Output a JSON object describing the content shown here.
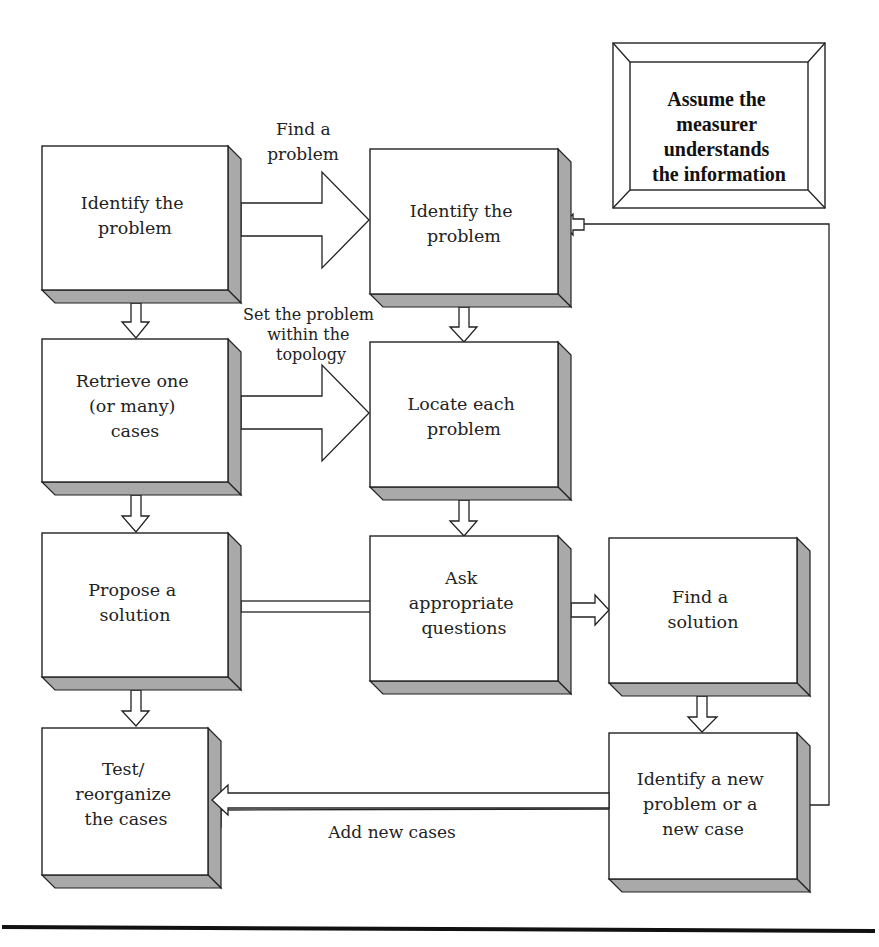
{
  "note_box": {
    "lines": [
      "Assume the",
      "measurer",
      "understands",
      "the information"
    ]
  },
  "boxes": {
    "identify_problem_left": {
      "lines": [
        "Identify the",
        "problem"
      ]
    },
    "retrieve_cases": {
      "lines": [
        "Retrieve one",
        "(or many)",
        "cases"
      ]
    },
    "propose_solution": {
      "lines": [
        "Propose a",
        "solution"
      ]
    },
    "test_reorganize": {
      "lines": [
        "Test/",
        "reorganize",
        "the cases"
      ]
    },
    "identify_problem_mid": {
      "lines": [
        "Identify the",
        "problem"
      ]
    },
    "locate_problem": {
      "lines": [
        "Locate each",
        "problem"
      ]
    },
    "ask_questions": {
      "lines": [
        "Ask",
        "appropriate",
        "questions"
      ]
    },
    "find_solution": {
      "lines": [
        "Find a",
        "solution"
      ]
    },
    "identify_new_problem": {
      "lines": [
        "Identify a new",
        "problem or a",
        "new case"
      ]
    }
  },
  "arrow_labels": {
    "find_problem": [
      "Find  a",
      "problem"
    ],
    "set_problem": [
      "Set the problem",
      "within the",
      "topology"
    ],
    "add_new_cases": [
      "Add new cases"
    ]
  },
  "colors": {
    "depth_shade": "#a9a9a9",
    "stroke": "#222222",
    "background": "#ffffff"
  }
}
